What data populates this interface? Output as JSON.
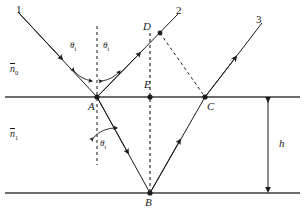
{
  "figure": {
    "type": "optics-ray-diagram",
    "boundaries": {
      "top_y": 97,
      "bottom_y": 193,
      "left_x": 5,
      "right_x": 300
    },
    "points": [
      {
        "id": "A",
        "label": "A",
        "x": 97,
        "y": 97,
        "label_x": 88,
        "label_y": 101,
        "dot": true
      },
      {
        "id": "B",
        "label": "B",
        "x": 150,
        "y": 193,
        "label_x": 145,
        "label_y": 197,
        "dot": true
      },
      {
        "id": "C",
        "label": "C",
        "x": 205,
        "y": 97,
        "label_x": 207,
        "label_y": 101,
        "dot": true
      },
      {
        "id": "D",
        "label": "D",
        "x": 160,
        "y": 33,
        "label_x": 143,
        "label_y": 21,
        "dot": true
      },
      {
        "id": "E",
        "label": "E",
        "x": 150,
        "y": 97,
        "label_x": 144,
        "label_y": 79,
        "dot": true
      }
    ],
    "rays": [
      {
        "id": "1",
        "label": "1",
        "label_x": 16,
        "label_y": 4
      },
      {
        "id": "2",
        "label": "2",
        "label_x": 176,
        "label_y": 5
      },
      {
        "id": "3",
        "label": "3",
        "label_x": 256,
        "label_y": 14
      }
    ],
    "angles": [
      {
        "id": "theta-i-incident",
        "symbol": "θ",
        "sub": "i",
        "label_x": 70,
        "label_y": 41
      },
      {
        "id": "theta-i-reflected",
        "symbol": "θ",
        "sub": "i",
        "label_x": 103,
        "label_y": 41
      },
      {
        "id": "theta-t-transmitted",
        "symbol": "θ",
        "sub": "t",
        "label_x": 100,
        "label_y": 139
      }
    ],
    "media": [
      {
        "id": "n0",
        "symbol": "n",
        "sub": "0",
        "label_x": 10,
        "label_y": 63,
        "region": "above-film"
      },
      {
        "id": "n1",
        "symbol": "n",
        "sub": "1",
        "label_x": 10,
        "label_y": 128,
        "region": "film"
      }
    ],
    "dimension": {
      "id": "h",
      "label": "h",
      "label_x": 279,
      "label_y": 138,
      "arrow_x": 268,
      "top_y": 97,
      "bottom_y": 193
    },
    "colors": {
      "stroke": "#1b1b1b",
      "boundary": "#3c3c3c",
      "background": "#ffffff"
    }
  }
}
